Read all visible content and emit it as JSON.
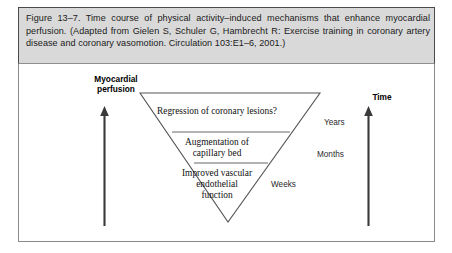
{
  "figure": {
    "caption": "Figure 13–7. Time course of physical activity–induced mechanisms that enhance myocardial perfusion. (Adapted from Gielen S, Schuler G, Hambrecht R: Exercise training in coronary artery disease and coronary vasomotion. Circulation 103:E1–6, 2001.)",
    "frame_border_color": "#8a8a8a",
    "caption_background": "#d9d9d9"
  },
  "diagram": {
    "type": "inverted-triangle-tiers",
    "y_axis": {
      "label": "Myocardial\nperfusion",
      "label_line1": "Myocardial",
      "label_line2": "perfusion",
      "direction": "up"
    },
    "x_axis": {
      "label": "Time",
      "direction": "up"
    },
    "tiers": [
      {
        "index": 1,
        "text": "Regression of coronary lesions?",
        "lines": [
          "Regression of coronary lesions?"
        ],
        "scale_label": "Years"
      },
      {
        "index": 2,
        "text": "Augmentation of capillary bed",
        "lines": [
          "Augmentation of",
          "capillary bed"
        ],
        "scale_label": "Months"
      },
      {
        "index": 3,
        "text": "Improved vascular endothelial function",
        "lines": [
          "Improved vascular",
          "endothelial",
          "function"
        ],
        "scale_label": "Weeks"
      }
    ],
    "line_color": "#555555",
    "text_color": "#111111"
  }
}
